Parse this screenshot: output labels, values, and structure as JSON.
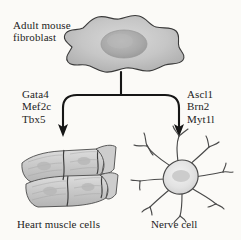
{
  "figure": {
    "type": "direct-reprogramming-diagram",
    "background_color": "#fbfaf7",
    "ink_color": "#232323",
    "cell_fill_color": "#c9c9c9",
    "nucleus_color": "#a8a8a8"
  },
  "source": {
    "label": "Adult mouse\nfibroblast",
    "cell_name": "fibroblast-cell"
  },
  "branches": [
    {
      "id": "cardiac",
      "factors_label": "Gata4\nMef2c\nTbx5",
      "factors": [
        "Gata4",
        "Mef2c",
        "Tbx5"
      ],
      "caption": "Heart muscle cells",
      "cell_name": "cardiomyocyte-cells"
    },
    {
      "id": "neuronal",
      "factors_label": "Ascl1\nBrn2\nMyt1l",
      "factors": [
        "Ascl1",
        "Brn2",
        "Myt1l"
      ],
      "caption": "Nerve cell",
      "cell_name": "neuron-cell"
    }
  ],
  "arrows": {
    "stem_name": "stem-arrow",
    "split_name": "branch-connector",
    "left_arrow_name": "arrow-to-heart-muscle",
    "right_arrow_name": "arrow-to-nerve-cell"
  }
}
